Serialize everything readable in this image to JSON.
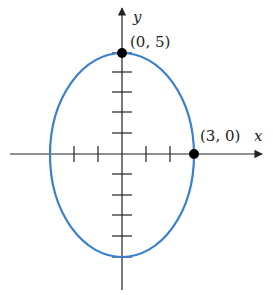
{
  "diagram": {
    "type": "ellipse-graph",
    "equation_semiaxes": {
      "a_x": 3,
      "b_y": 5
    },
    "axes": {
      "x_label": "x",
      "y_label": "y"
    },
    "points": [
      {
        "label": "(0, 5)",
        "x": 0,
        "y": 5
      },
      {
        "label": "(3, 0)",
        "x": 3,
        "y": 0
      }
    ],
    "ticks": {
      "x": [
        -3,
        -2,
        -1,
        1,
        2,
        3
      ],
      "y": [
        -5,
        -4,
        -3,
        -2,
        -1,
        1,
        2,
        3,
        4,
        5
      ]
    },
    "colors": {
      "ellipse": "#3a7fd0",
      "axes": "#222222",
      "points": "#000000"
    }
  }
}
